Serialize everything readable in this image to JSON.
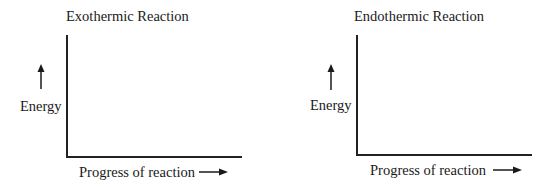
{
  "diagrams": [
    {
      "title": "Exothermic Reaction",
      "y_axis_label": "Energy",
      "y_axis_arrow": "arrow-up-icon",
      "x_axis_label": "Progress of reaction",
      "x_axis_arrow": "arrow-right-icon"
    },
    {
      "title": "Endothermic Reaction",
      "y_axis_label": "Energy",
      "y_axis_arrow": "arrow-up-icon",
      "x_axis_label": "Progress of reaction",
      "x_axis_arrow": "arrow-right-icon"
    }
  ],
  "colors": {
    "ink": "#1a1a1a",
    "background": "#ffffff"
  }
}
